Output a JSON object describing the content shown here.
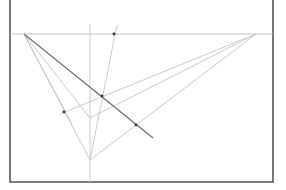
{
  "diagram": {
    "type": "two-point perspective construction",
    "colors": {
      "frame": "#555555",
      "construction_lines": "#c4c4c4",
      "main_line": "#6a6a6a",
      "points": "#333333",
      "background": "#ffffff"
    },
    "frame": {
      "left": 10,
      "right": 273,
      "top": 0,
      "bottom": 182
    },
    "horizon": {
      "y": 34,
      "x1": 10,
      "x2": 273
    },
    "vanishing_points": [
      {
        "name": "left-vanishing-point",
        "x": 24,
        "y": 34
      },
      {
        "name": "right-vanishing-point",
        "x": 256,
        "y": 34
      }
    ],
    "vertical_line": {
      "x": 90,
      "y1": 24,
      "y2": 182
    },
    "main_line": {
      "x1": 24,
      "y1": 34,
      "x2": 153,
      "y2": 138
    },
    "lines": [
      {
        "x1": 24,
        "y1": 34,
        "x2": 90,
        "y2": 160
      },
      {
        "x1": 24,
        "y1": 34,
        "x2": 90,
        "y2": 118
      },
      {
        "x1": 24,
        "y1": 34,
        "x2": 72,
        "y2": 124
      },
      {
        "x1": 256,
        "y1": 34,
        "x2": 90,
        "y2": 160
      },
      {
        "x1": 256,
        "y1": 34,
        "x2": 90,
        "y2": 118
      },
      {
        "x1": 256,
        "y1": 34,
        "x2": 60,
        "y2": 114
      },
      {
        "x1": 117,
        "y1": 25,
        "x2": 90,
        "y2": 160
      }
    ],
    "points": [
      {
        "name": "horizon-point",
        "x": 114,
        "y": 34
      },
      {
        "name": "left-marked-point",
        "x": 64,
        "y": 112
      },
      {
        "name": "intersection-point",
        "x": 102,
        "y": 96
      },
      {
        "name": "main-line-point",
        "x": 136,
        "y": 125
      }
    ]
  }
}
